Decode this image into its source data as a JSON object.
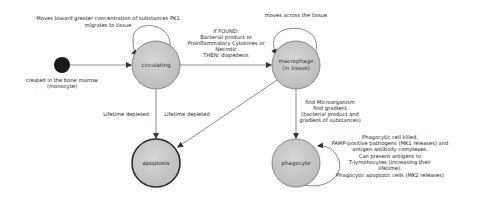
{
  "colors": {
    "state_fill": "#c8c8c8",
    "state_stroke": "#707070",
    "final_stroke": "#2a2a2a",
    "initial_fill": "#1a1a1a",
    "edge": "#555555"
  },
  "initial": {
    "label_line1": "created in the bone marrow",
    "label_line2": "(monocyte)"
  },
  "states": {
    "circulating": {
      "label": "circulating"
    },
    "macrophage": {
      "label_line1": "macrophage",
      "label_line2": "(in tissue)"
    },
    "apoptosis": {
      "label": "apoptosis"
    },
    "phagocyte": {
      "label": "phagocyte"
    }
  },
  "transitions": {
    "circulating_self": {
      "line1": "Moves toward greater concentration of substances PK1",
      "line2": "migrates to tissue"
    },
    "circulating_to_macrophage": {
      "line1": "If FOUND:",
      "line2": "Bacterial product or",
      "line3": "Proinflammatory Cytokines or",
      "line4": "Necrotic",
      "line5": "THEN: diapedesis"
    },
    "macrophage_self": {
      "line1": "moves across the tissue"
    },
    "circulating_to_apoptosis": {
      "line1": "Lifetime depleted"
    },
    "macrophage_to_apoptosis": {
      "line1": "Lifetime depleted"
    },
    "macrophage_to_phagocyte": {
      "line1": "find Microorganism",
      "line2": "find gradient",
      "line3": "(bacterial product and",
      "line4": "gradient of substances)"
    },
    "phagocyte_self": {
      "line1": "Phagocytic cell killed,",
      "line2": "PAMP-positive pathogens (MK1 releases) and",
      "line3": "antigen-antibody complexes.",
      "line4": "Can present antigens to",
      "line5": "T-lymphocytes (increasing their",
      "line6": "lifetime).",
      "line7": "Phagocytic apoptotic cells (MK2 releases)"
    }
  }
}
